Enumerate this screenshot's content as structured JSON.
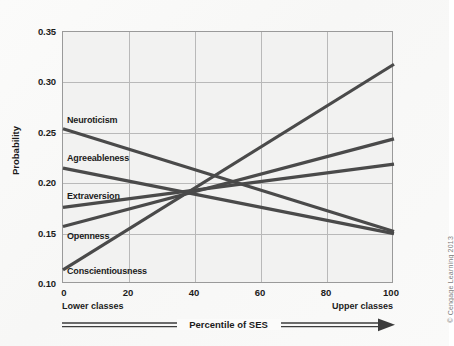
{
  "credit": "© Cengage Learning 2013",
  "axes": {
    "ylabel": "Probability",
    "xlabel": "Percentile of SES",
    "x_low_label": "Lower classes",
    "x_high_label": "Upper classes",
    "yticks": [
      "0.35",
      "0.30",
      "0.25",
      "0.20",
      "0.15",
      "0.10"
    ],
    "xticks": [
      "0",
      "20",
      "40",
      "60",
      "80",
      "100"
    ]
  },
  "series_labels": {
    "neuroticism": "Neuroticism",
    "agreeableness": "Agreeableness",
    "extraversion": "Extraversion",
    "openness": "Openness",
    "conscientiousness": "Conscientiousness"
  },
  "chart_data": {
    "type": "line",
    "title": "",
    "xlabel": "Percentile of SES",
    "ylabel": "Probability",
    "xlim": [
      0,
      100
    ],
    "ylim": [
      0.1,
      0.35
    ],
    "xticks": [
      0,
      20,
      40,
      60,
      80,
      100
    ],
    "yticks": [
      0.1,
      0.15,
      0.2,
      0.25,
      0.3,
      0.35
    ],
    "grid": true,
    "legend": "inline-labels-left",
    "x_axis_annotations": {
      "left": "Lower classes",
      "right": "Upper classes"
    },
    "line_color": "#4a4a4a",
    "x": [
      0,
      100
    ],
    "series": [
      {
        "name": "Neuroticism",
        "values": [
          0.254,
          0.152
        ]
      },
      {
        "name": "Agreeableness",
        "values": [
          0.215,
          0.15
        ]
      },
      {
        "name": "Extraversion",
        "values": [
          0.176,
          0.219
        ]
      },
      {
        "name": "Openness",
        "values": [
          0.157,
          0.244
        ]
      },
      {
        "name": "Conscientiousness",
        "values": [
          0.114,
          0.318
        ]
      }
    ]
  }
}
